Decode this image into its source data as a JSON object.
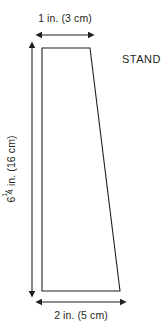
{
  "figure": {
    "title_label": "STAND",
    "shape": {
      "name": "trapezoid-stand-outline",
      "stroke_color": "#231f20",
      "fill_color": "#ffffff",
      "vertices": "42,48 90,48 120,291 42,291"
    },
    "labels": {
      "top_width": "1 in. (3 cm)",
      "bottom_width": "2 in. (5 cm)",
      "height_whole": "6",
      "height_fraction_numerator": "1",
      "height_fraction_denominator": "4",
      "height_units": " in. (16 cm)"
    },
    "dimensions": {
      "top_arrow": {
        "x1": 42,
        "x2": 88,
        "y": 35
      },
      "bottom_arrow": {
        "x1": 42,
        "x2": 120,
        "y": 302
      },
      "left_arrow": {
        "x": 32,
        "y1": 48,
        "y2": 291
      }
    },
    "colors": {
      "background": "#ffffff",
      "line": "#231f20",
      "text": "#231f20"
    }
  }
}
